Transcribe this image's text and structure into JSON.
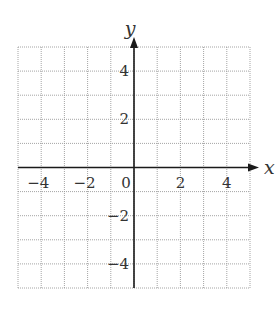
{
  "chart_data": {
    "type": "scatter",
    "title": "",
    "xlabel": "x",
    "ylabel": "y",
    "xlim": [
      -5,
      5
    ],
    "ylim": [
      -5,
      5
    ],
    "grid": true,
    "grid_step": 1,
    "grid_style": "dotted",
    "x_ticks": [
      {
        "value": -4,
        "label": "−4"
      },
      {
        "value": -2,
        "label": "−2"
      },
      {
        "value": 0,
        "label": "0"
      },
      {
        "value": 2,
        "label": "2"
      },
      {
        "value": 4,
        "label": "4"
      }
    ],
    "y_ticks": [
      {
        "value": 4,
        "label": "4"
      },
      {
        "value": 2,
        "label": "2"
      },
      {
        "value": -2,
        "label": "−2"
      },
      {
        "value": -4,
        "label": "−4"
      }
    ],
    "series": [],
    "colors": {
      "axis": "#1a1a1a",
      "grid": "#9a9a9a",
      "text": "#333333",
      "background": "#ffffff"
    }
  }
}
